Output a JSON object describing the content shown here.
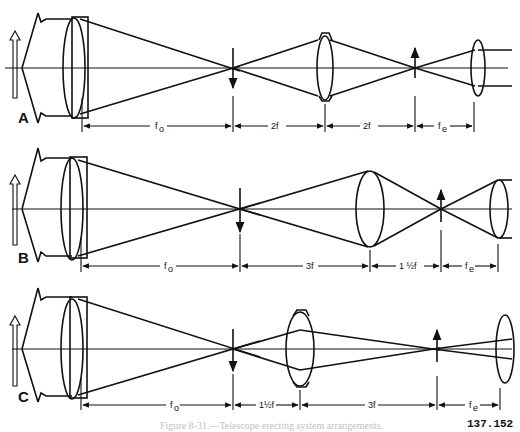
{
  "figure": {
    "number": "137.152",
    "caption": "Figure 8-31.—Telescope erecting system arrangements."
  },
  "panels": [
    {
      "letter": "A",
      "segments": [
        {
          "label": "fo",
          "main": "f",
          "sub": "o"
        },
        {
          "label": "2f",
          "main": "2f",
          "sub": ""
        },
        {
          "label": "2f",
          "main": "2f",
          "sub": ""
        },
        {
          "label": "fe",
          "main": "f",
          "sub": "e"
        }
      ]
    },
    {
      "letter": "B",
      "segments": [
        {
          "label": "fo",
          "main": "f",
          "sub": "o"
        },
        {
          "label": "3f",
          "main": "3f",
          "sub": ""
        },
        {
          "label": "1 ½f",
          "main": "1 ½f",
          "sub": ""
        },
        {
          "label": "fe",
          "main": "f",
          "sub": "e"
        }
      ]
    },
    {
      "letter": "C",
      "segments": [
        {
          "label": "fo",
          "main": "f",
          "sub": "o"
        },
        {
          "label": "1½f",
          "main": "1½f",
          "sub": ""
        },
        {
          "label": "3f",
          "main": "3f",
          "sub": ""
        },
        {
          "label": "fe",
          "main": "f",
          "sub": "e"
        }
      ]
    }
  ],
  "colors": {
    "ink": "#111111",
    "paper": "#ffffff"
  }
}
